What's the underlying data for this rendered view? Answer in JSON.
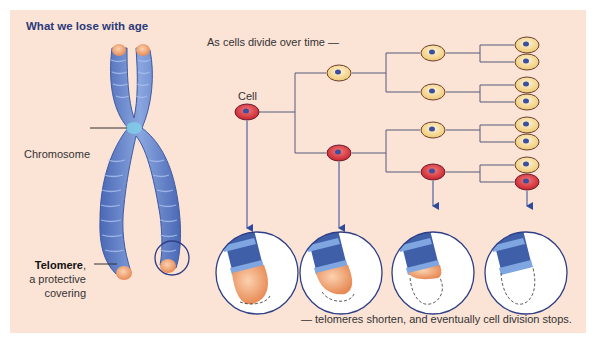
{
  "title": "What we lose with age",
  "subtitle": "As cells divide over time —",
  "footnote": "— telomeres shorten, and eventually cell division stops.",
  "labels": {
    "chromosome": "Chromosome",
    "cell": "Cell",
    "telomere_bold": "Telomere",
    "telomere_comma": ",",
    "telomere_line2": "a protective",
    "telomere_line3": "covering"
  },
  "colors": {
    "background": "#fbe3d6",
    "title": "#2a3a7a",
    "chromosome": "#6f8fd0",
    "chromosome_dark": "#3f5fa8",
    "telomere": "#f0a070",
    "healthy_cell": "#f3dca0",
    "aging_cell": "#d8333a",
    "nucleus": "#3a4fa0",
    "line": "#4a4f7a"
  },
  "stages": [
    {
      "name": "generation-1",
      "telomere_remaining": 1.0
    },
    {
      "name": "generation-2",
      "telomere_remaining": 0.85
    },
    {
      "name": "generation-3",
      "telomere_remaining": 0.35
    },
    {
      "name": "generation-4",
      "telomere_remaining": 0.0
    }
  ]
}
